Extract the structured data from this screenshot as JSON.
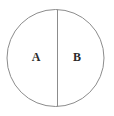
{
  "diagram": {
    "background_color": "#ffffff",
    "stroke_color": "#8c8c8c",
    "label_color": "#2b2b2b",
    "stroke_width": 1,
    "circle": {
      "center_x": 55.5,
      "center_y": 58,
      "radius": 48.5
    },
    "divider": {
      "orientation": "vertical",
      "x": 57.5,
      "y_top": 9.5,
      "y_bottom": 106.5
    },
    "regions": [
      {
        "label": "A",
        "side": "left",
        "label_x": 36,
        "label_y": 58
      },
      {
        "label": "B",
        "side": "right",
        "label_x": 77,
        "label_y": 58
      }
    ]
  }
}
